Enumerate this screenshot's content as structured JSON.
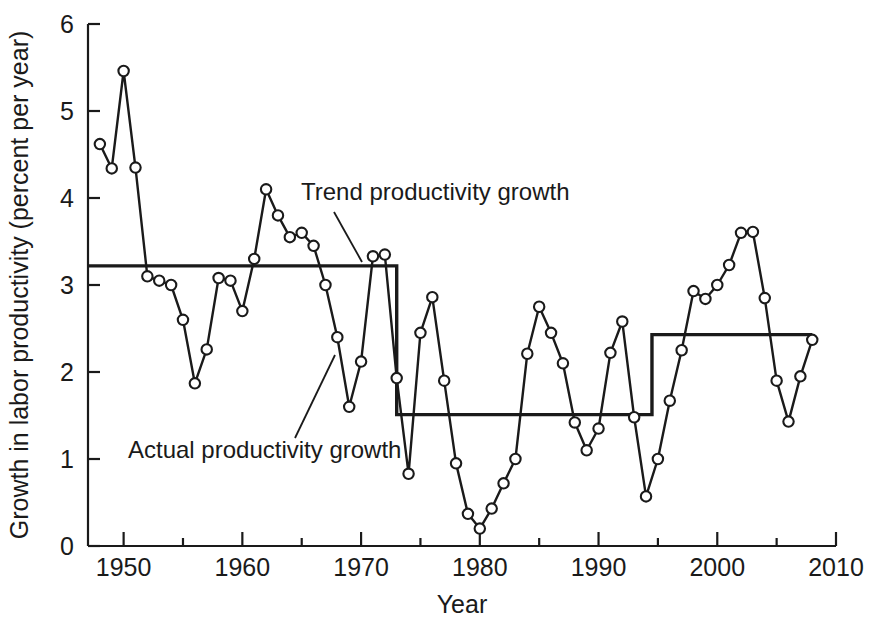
{
  "chart_data": {
    "type": "line",
    "title": "",
    "xlabel": "Year",
    "ylabel": "Growth in labor productivity (percent per year)",
    "xlim": [
      1947,
      2010
    ],
    "ylim": [
      0,
      6
    ],
    "xticks": [
      1950,
      1960,
      1970,
      1980,
      1990,
      2000,
      2010
    ],
    "xtick_labels": [
      "1950",
      "1960",
      "1970",
      "1980",
      "1990",
      "2000",
      "2010"
    ],
    "x_minor_ticks": [
      1955,
      1965,
      1975,
      1985,
      1995,
      2005
    ],
    "yticks": [
      0,
      1,
      2,
      3,
      4,
      5,
      6
    ],
    "ytick_labels": [
      "0",
      "1",
      "2",
      "3",
      "4",
      "5",
      "6"
    ],
    "grid": false,
    "legend": "none",
    "series": [
      {
        "name": "Actual productivity growth",
        "marker": "open-circle",
        "x": [
          1948,
          1949,
          1950,
          1951,
          1952,
          1953,
          1954,
          1955,
          1956,
          1957,
          1958,
          1959,
          1960,
          1961,
          1962,
          1963,
          1964,
          1965,
          1966,
          1967,
          1968,
          1969,
          1970,
          1971,
          1972,
          1973,
          1974,
          1975,
          1976,
          1977,
          1978,
          1979,
          1980,
          1981,
          1982,
          1983,
          1984,
          1985,
          1986,
          1987,
          1988,
          1989,
          1990,
          1991,
          1992,
          1993,
          1994,
          1995,
          1996,
          1997,
          1998,
          1999,
          2000,
          2001,
          2002,
          2003,
          2004,
          2005,
          2006,
          2007,
          2008
        ],
        "values": [
          4.62,
          4.34,
          5.46,
          4.35,
          3.1,
          3.05,
          3.0,
          2.6,
          1.87,
          2.26,
          3.08,
          3.05,
          2.7,
          3.3,
          4.1,
          3.8,
          3.55,
          3.6,
          3.45,
          3.0,
          2.4,
          1.6,
          2.12,
          3.33,
          3.35,
          1.93,
          0.83,
          2.45,
          2.86,
          1.9,
          0.95,
          0.37,
          0.2,
          0.43,
          0.72,
          1.0,
          2.21,
          2.75,
          2.45,
          2.1,
          1.42,
          1.1,
          1.35,
          2.22,
          2.58,
          1.48,
          0.57,
          1.0,
          1.67,
          2.25,
          2.93,
          2.84,
          3.0,
          3.23,
          3.6,
          3.61,
          2.85,
          1.9,
          1.43,
          1.95,
          2.37
        ]
      },
      {
        "name": "Trend productivity growth",
        "marker": "none",
        "style": "step",
        "segments": [
          {
            "x_start": 1947,
            "x_end": 1973,
            "value": 3.22
          },
          {
            "x_start": 1973,
            "x_end": 1994.5,
            "value": 1.51
          },
          {
            "x_start": 1994.5,
            "x_end": 2008,
            "value": 2.43
          }
        ]
      }
    ],
    "annotations": [
      {
        "name": "trend-annotation",
        "text": "Trend productivity growth",
        "text_x": 301,
        "text_y": 200,
        "leader": {
          "x1": 334,
          "y1": 212,
          "x2": 362,
          "y2": 262
        }
      },
      {
        "name": "actual-annotation",
        "text": "Actual productivity growth",
        "text_x": 128,
        "text_y": 458,
        "leader": {
          "x1": 295,
          "y1": 438,
          "x2": 335,
          "y2": 355
        }
      }
    ]
  },
  "axes": {
    "x_axis_title": "Year",
    "y_axis_title": "Growth in labor productivity (percent per year)"
  },
  "colors": {
    "ink": "#1a1a1a",
    "background": "#ffffff",
    "marker_fill": "#ffffff"
  }
}
